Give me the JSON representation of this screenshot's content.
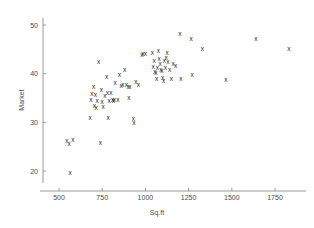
{
  "chart_data": {
    "type": "scatter",
    "title": "",
    "xlabel": "Sq.ft",
    "ylabel": "Market",
    "xlim": [
      470,
      1900
    ],
    "ylim": [
      17,
      51.5
    ],
    "xticks": [
      500,
      750,
      1000,
      1250,
      1500,
      1750
    ],
    "xtick_labels": [
      "500",
      "750",
      "1000",
      "1250",
      "1500",
      "1750"
    ],
    "yticks": [
      20,
      30,
      40,
      50
    ],
    "ytick_labels": [
      "20",
      "30",
      "40",
      "50"
    ],
    "grid": false,
    "legend": false,
    "marker": "x",
    "marker_color": "#1c1c1c",
    "axis_color": "#8e8e8e",
    "points": [
      [
        545,
        26.2
      ],
      [
        558,
        25.4
      ],
      [
        580,
        26.3
      ],
      [
        565,
        19.5
      ],
      [
        680,
        30.9
      ],
      [
        685,
        34.6
      ],
      [
        690,
        35.8
      ],
      [
        700,
        37.2
      ],
      [
        705,
        33.2
      ],
      [
        710,
        35.6
      ],
      [
        715,
        32.9
      ],
      [
        720,
        34.3
      ],
      [
        730,
        42.3
      ],
      [
        740,
        25.6
      ],
      [
        745,
        36.6
      ],
      [
        750,
        34.1
      ],
      [
        755,
        33.0
      ],
      [
        765,
        35.3
      ],
      [
        775,
        39.3
      ],
      [
        780,
        35.9
      ],
      [
        785,
        30.9
      ],
      [
        790,
        34.4
      ],
      [
        800,
        36.0
      ],
      [
        810,
        34.6
      ],
      [
        815,
        34.4
      ],
      [
        820,
        34.5
      ],
      [
        825,
        38.0
      ],
      [
        840,
        34.5
      ],
      [
        850,
        39.7
      ],
      [
        860,
        37.4
      ],
      [
        870,
        37.6
      ],
      [
        880,
        40.6
      ],
      [
        890,
        37.6
      ],
      [
        900,
        37.3
      ],
      [
        905,
        35.0
      ],
      [
        910,
        37.1
      ],
      [
        930,
        30.6
      ],
      [
        933,
        29.8
      ],
      [
        945,
        38.3
      ],
      [
        960,
        37.6
      ],
      [
        980,
        43.8
      ],
      [
        985,
        43.9
      ],
      [
        1000,
        43.9
      ],
      [
        1040,
        44.2
      ],
      [
        1045,
        41.4
      ],
      [
        1050,
        42.6
      ],
      [
        1055,
        40.2
      ],
      [
        1060,
        40.0
      ],
      [
        1065,
        38.9
      ],
      [
        1070,
        41.2
      ],
      [
        1075,
        44.5
      ],
      [
        1080,
        43.0
      ],
      [
        1085,
        42.0
      ],
      [
        1090,
        40.6
      ],
      [
        1095,
        40.4
      ],
      [
        1100,
        39.0
      ],
      [
        1105,
        38.5
      ],
      [
        1110,
        42.5
      ],
      [
        1115,
        41.2
      ],
      [
        1120,
        43.1
      ],
      [
        1125,
        44.2
      ],
      [
        1130,
        42.4
      ],
      [
        1140,
        40.6
      ],
      [
        1150,
        38.9
      ],
      [
        1160,
        42.0
      ],
      [
        1175,
        41.5
      ],
      [
        1200,
        48.1
      ],
      [
        1205,
        38.9
      ],
      [
        1265,
        47.1
      ],
      [
        1270,
        39.6
      ],
      [
        1330,
        45.0
      ],
      [
        1465,
        38.7
      ],
      [
        1640,
        47.1
      ],
      [
        1830,
        45.0
      ]
    ]
  }
}
